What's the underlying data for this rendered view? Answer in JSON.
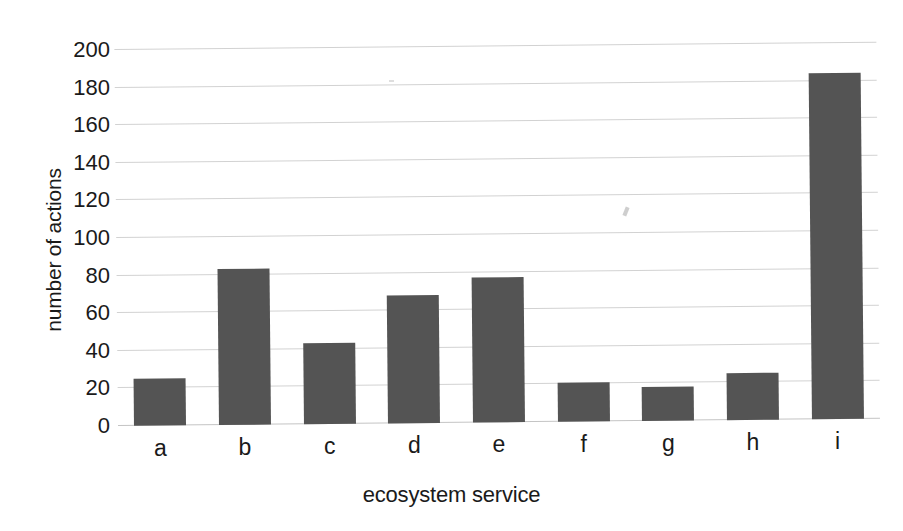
{
  "chart_data": {
    "type": "bar",
    "title": "",
    "subtitle": "",
    "xlabel": "ecosystem service",
    "ylabel": "number of actions",
    "categories": [
      "a",
      "b",
      "c",
      "d",
      "e",
      "f",
      "g",
      "h",
      "i"
    ],
    "values": [
      25,
      83,
      43,
      68,
      77,
      21,
      18,
      25,
      184
    ],
    "series": [
      {
        "name": "number of actions",
        "values": [
          25,
          83,
          43,
          68,
          77,
          21,
          18,
          25,
          184
        ]
      }
    ],
    "ylim": [
      0,
      200
    ],
    "ytick_step": 20,
    "yticks": [
      0,
      20,
      40,
      60,
      80,
      100,
      120,
      140,
      160,
      180,
      200
    ],
    "ytick_labels": [
      "0",
      "20",
      "40",
      "60",
      "80",
      "100",
      "120",
      "140",
      "160",
      "180",
      "200"
    ],
    "grid": true,
    "grid_axis": "y",
    "legend": false,
    "legend_position": "none",
    "annotations": [],
    "colors": {
      "bar": "#545454",
      "gridline": "#d2d2d2",
      "axis": "#c4c4c4",
      "background": "#ffffff",
      "text": "#1a1a1a"
    }
  }
}
